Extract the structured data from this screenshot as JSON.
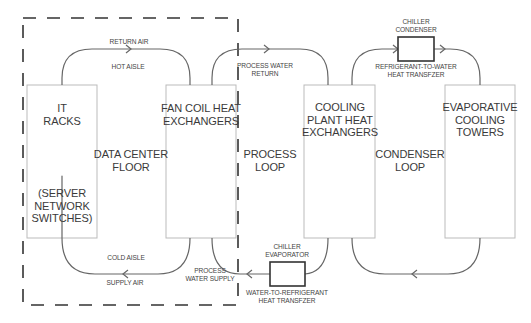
{
  "diagram": {
    "type": "data-center-cooling-flow",
    "colors": {
      "line": "#666666",
      "box_border": "#bbbbbb",
      "equipment_border": "#333333",
      "dashed_border": "#333333"
    },
    "boundary": {
      "name": "Data center boundary",
      "style": "dashed"
    },
    "blocks": {
      "it_racks": {
        "line1": "IT",
        "line2": "RACKS",
        "note1": "(SERVER",
        "note2": "NETWORK",
        "note3": "SWITCHES)"
      },
      "fan_coil": {
        "line1": "FAN COIL HEAT",
        "line2": "EXCHANGERS"
      },
      "cooling_plant": {
        "line1": "COOLING",
        "line2": "PLANT HEAT",
        "line3": "EXCHANGERS"
      },
      "evaporative": {
        "line1": "EVAPORATIVE",
        "line2": "COOLING",
        "line3": "TOWERS"
      }
    },
    "regions": {
      "data_center_floor": {
        "line1": "DATA CENTER",
        "line2": "FLOOR"
      },
      "process_loop": {
        "line1": "PROCESS",
        "line2": "LOOP"
      },
      "condenser_loop": {
        "line1": "CONDENSER",
        "line2": "LOOP"
      }
    },
    "flow_labels": {
      "return_air": "RETURN AIR",
      "hot_aisle": "HOT AISLE",
      "cold_aisle": "COLD AISLE",
      "supply_air": "SUPPLY AIR",
      "process_water_return_1": "PROCESS WATER",
      "process_water_return_2": "RETURN",
      "process_water_supply_1": "PROCESS",
      "process_water_supply_2": "WATER SUPPLY"
    },
    "equipment": {
      "chiller_condenser": {
        "title1": "CHILLER",
        "title2": "CONDENSER",
        "desc1": "REFRIGERANT-TO-WATER",
        "desc2": "HEAT TRANSFZER"
      },
      "chiller_evaporator": {
        "title1": "CHILLER",
        "title2": "EVAPORATOR",
        "desc1": "WATER-TO-REFRIGERANT",
        "desc2": "HEAT TRANSFZER"
      }
    }
  }
}
